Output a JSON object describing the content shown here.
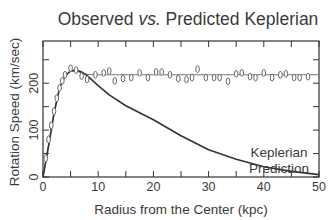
{
  "chart_data": {
    "type": "line",
    "title_parts": [
      "Observed ",
      "vs.",
      " Predicted Keplerian"
    ],
    "title": "Observed vs. Predicted Keplerian",
    "xlabel": "Radius from the Center (kpc)",
    "ylabel": "Rotation Speed (km/sec)",
    "xlim": [
      0,
      50
    ],
    "ylim": [
      0,
      290
    ],
    "xticks": [
      0,
      10,
      20,
      30,
      40,
      50
    ],
    "xminor": [
      5,
      15,
      25,
      35,
      45
    ],
    "yticks": [
      0,
      100,
      200
    ],
    "yminor": [
      50,
      150,
      250
    ],
    "grid": false,
    "legend": null,
    "annotations": [
      {
        "text": "Keplerian",
        "x": 39,
        "y": 100
      },
      {
        "text": "Prediction",
        "x": 39,
        "y": 75
      }
    ],
    "series": [
      {
        "name": "Observed",
        "style": "markers (ellipses) with fitted line",
        "x": [
          0.5,
          1.0,
          1.5,
          2.0,
          2.5,
          3.0,
          3.5,
          4.0,
          5.0,
          6.0,
          7.0,
          8.0,
          9.5,
          11.0,
          12.0,
          13.0,
          14.5,
          16.0,
          17.5,
          19.0,
          20.5,
          21.5,
          23.0,
          24.5,
          26.0,
          27.0,
          28.0,
          29.5,
          31.0,
          32.0,
          33.5,
          35.0,
          36.0,
          37.5,
          38.5,
          40.0,
          41.5,
          43.0,
          44.0,
          45.5,
          46.5,
          48.0
        ],
        "y": [
          40,
          80,
          110,
          140,
          168,
          190,
          205,
          218,
          232,
          228,
          215,
          208,
          218,
          222,
          226,
          205,
          210,
          212,
          222,
          212,
          224,
          224,
          218,
          210,
          208,
          212,
          230,
          212,
          212,
          212,
          204,
          220,
          222,
          214,
          212,
          222,
          212,
          218,
          220,
          212,
          212,
          214
        ],
        "fit_line": {
          "x": [
            0,
            1,
            2,
            3,
            4,
            5,
            6,
            7,
            8,
            10,
            15,
            20,
            30,
            40,
            50
          ],
          "y": [
            0,
            70,
            140,
            190,
            215,
            225,
            226,
            222,
            219,
            218,
            218,
            218,
            218,
            218,
            218
          ]
        }
      },
      {
        "name": "Keplerian Prediction",
        "style": "solid line",
        "x": [
          0,
          1,
          2,
          3,
          4,
          5,
          6,
          7,
          8,
          10,
          12,
          15,
          20,
          25,
          30,
          35,
          40,
          45,
          50
        ],
        "y": [
          0,
          65,
          135,
          190,
          216,
          226,
          228,
          224,
          216,
          195,
          175,
          152,
          122,
          88,
          58,
          38,
          22,
          12,
          5
        ]
      }
    ]
  }
}
